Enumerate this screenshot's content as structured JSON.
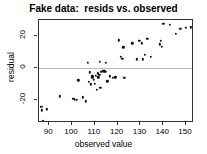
{
  "chart_data": {
    "type": "scatter",
    "title": "Fake data:  resids vs. observed",
    "xlabel": "observed value",
    "ylabel": "residual",
    "xlim": [
      85.5,
      153.5
    ],
    "ylim": [
      -34,
      30
    ],
    "xticks": [
      90,
      100,
      110,
      120,
      130,
      140,
      150
    ],
    "xtick_labels": [
      "90",
      "100",
      "110",
      "120",
      "130",
      "140",
      "150"
    ],
    "yticks": [
      20,
      0,
      -20
    ],
    "ytick_labels": [
      "20",
      "0",
      "-20"
    ],
    "grid": false,
    "legend": null,
    "reference_lines": [
      {
        "axis": "y",
        "value": 0,
        "color": "#bbbbbb"
      }
    ],
    "point_color": "#111111",
    "points": [
      {
        "x": 86.5,
        "y": -24.0
      },
      {
        "x": 86.8,
        "y": -26.0
      },
      {
        "x": 87.2,
        "y": -32.5
      },
      {
        "x": 89.0,
        "y": -25.5
      },
      {
        "x": 94.6,
        "y": -17.5
      },
      {
        "x": 100.6,
        "y": -19.0
      },
      {
        "x": 101.3,
        "y": -19.5
      },
      {
        "x": 102.0,
        "y": -19.5
      },
      {
        "x": 102.7,
        "y": -7.5
      },
      {
        "x": 104.8,
        "y": -18.0
      },
      {
        "x": 106.0,
        "y": -20.5
      },
      {
        "x": 107.0,
        "y": 3.5
      },
      {
        "x": 107.4,
        "y": -8.5
      },
      {
        "x": 107.8,
        "y": -2.5
      },
      {
        "x": 108.2,
        "y": -10.0
      },
      {
        "x": 108.6,
        "y": -6.0
      },
      {
        "x": 108.9,
        "y": -5.0
      },
      {
        "x": 109.2,
        "y": -5.5
      },
      {
        "x": 109.6,
        "y": -7.0
      },
      {
        "x": 110.0,
        "y": -9.5
      },
      {
        "x": 110.4,
        "y": -4.5
      },
      {
        "x": 110.8,
        "y": -13.5
      },
      {
        "x": 111.2,
        "y": -3.0
      },
      {
        "x": 111.6,
        "y": -5.5
      },
      {
        "x": 112.0,
        "y": -4.0
      },
      {
        "x": 112.4,
        "y": -12.0
      },
      {
        "x": 112.9,
        "y": -2.0
      },
      {
        "x": 113.4,
        "y": -1.5
      },
      {
        "x": 113.8,
        "y": -1.8
      },
      {
        "x": 114.2,
        "y": -1.5
      },
      {
        "x": 114.6,
        "y": -2.0
      },
      {
        "x": 112.2,
        "y": 4.0
      },
      {
        "x": 114.8,
        "y": 3.5
      },
      {
        "x": 115.5,
        "y": -8.0
      },
      {
        "x": 116.5,
        "y": -5.0
      },
      {
        "x": 118.0,
        "y": -6.0
      },
      {
        "x": 119.0,
        "y": -5.5
      },
      {
        "x": 120.5,
        "y": 17.5
      },
      {
        "x": 121.5,
        "y": 7.0
      },
      {
        "x": 122.0,
        "y": 6.0
      },
      {
        "x": 122.5,
        "y": 13.0
      },
      {
        "x": 123.0,
        "y": -6.0
      },
      {
        "x": 126.5,
        "y": 15.5
      },
      {
        "x": 128.5,
        "y": 5.5
      },
      {
        "x": 129.5,
        "y": 17.0
      },
      {
        "x": 130.5,
        "y": 15.5
      },
      {
        "x": 131.0,
        "y": 5.5
      },
      {
        "x": 132.0,
        "y": 8.5
      },
      {
        "x": 133.0,
        "y": 18.5
      },
      {
        "x": 134.5,
        "y": 7.0
      },
      {
        "x": 138.5,
        "y": 15.0
      },
      {
        "x": 139.0,
        "y": 17.0
      },
      {
        "x": 139.3,
        "y": 13.5
      },
      {
        "x": 140.0,
        "y": 27.5
      },
      {
        "x": 143.0,
        "y": 27.0
      },
      {
        "x": 145.5,
        "y": 21.5
      },
      {
        "x": 147.5,
        "y": 24.5
      },
      {
        "x": 150.0,
        "y": 25.0
      },
      {
        "x": 152.0,
        "y": 25.5
      }
    ]
  }
}
